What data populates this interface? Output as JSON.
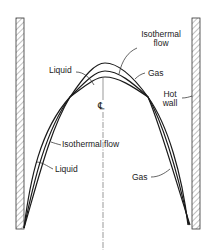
{
  "diagram": {
    "curves": [
      {
        "name": "Liquid",
        "peak_y": 63
      },
      {
        "name": "Isothermal flow",
        "peak_y": 71
      },
      {
        "name": "Gas",
        "peak_y": 77
      }
    ],
    "labels": {
      "liquid_top": "Liquid",
      "isothermal_top_line1": "Isothermal",
      "isothermal_top_line2": "flow",
      "gas_top": "Gas",
      "hot_wall_line1": "Hot",
      "hot_wall_line2": "wall",
      "centerline_symbol": "℄",
      "isothermal_bottom": "Isothermal flow",
      "liquid_bottom": "Liquid",
      "gas_bottom": "Gas"
    },
    "colors": {
      "line": "#1a1a1a",
      "hatch": "#555555",
      "background": "#ffffff"
    }
  }
}
